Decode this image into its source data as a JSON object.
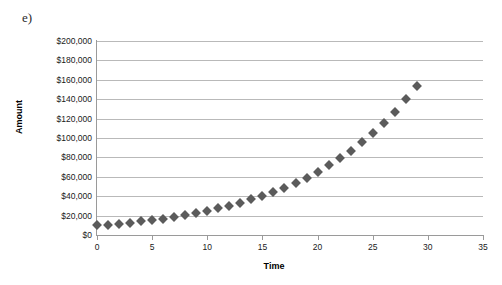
{
  "figure": {
    "part_label": "e)"
  },
  "chart_data": {
    "type": "scatter",
    "title": "",
    "xlabel": "Time",
    "ylabel": "Amount",
    "grid": true,
    "legend": false,
    "xlim": [
      0,
      35
    ],
    "ylim": [
      0,
      200000
    ],
    "xticks": [
      0,
      5,
      10,
      15,
      20,
      25,
      30,
      35
    ],
    "xtick_labels": [
      "0",
      "5",
      "10",
      "15",
      "20",
      "25",
      "30",
      "35"
    ],
    "yticks": [
      0,
      20000,
      40000,
      60000,
      80000,
      100000,
      120000,
      140000,
      160000,
      180000,
      200000
    ],
    "ytick_labels": [
      "$0",
      "$20,000",
      "$40,000",
      "$60,000",
      "$80,000",
      "$100,000",
      "$120,000",
      "$140,000",
      "$160,000",
      "$180,000",
      "$200,000"
    ],
    "marker": "diamond",
    "marker_color": "#5b5b5b",
    "grid_color": "#b9b9b9",
    "x": [
      0,
      1,
      2,
      3,
      4,
      5,
      6,
      7,
      8,
      9,
      10,
      11,
      12,
      13,
      14,
      15,
      16,
      17,
      18,
      19,
      20,
      21,
      22,
      23,
      24,
      25,
      26,
      27,
      28,
      29
    ],
    "values": [
      10000,
      10500,
      11600,
      12700,
      14000,
      15400,
      17000,
      18700,
      20600,
      22700,
      25000,
      27500,
      30300,
      33300,
      36700,
      40400,
      44400,
      48900,
      53800,
      59200,
      65100,
      71700,
      78900,
      86800,
      95500,
      105000,
      115500,
      127100,
      139800,
      153800
    ],
    "annotation": "Exponential / compound growth curve starting near $10,000 and rising to about $185,000"
  }
}
